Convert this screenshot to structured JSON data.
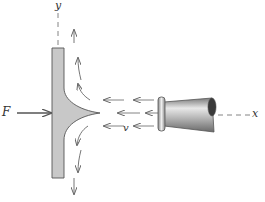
{
  "diagram": {
    "title": "",
    "type": "physics-free-body-jet-impinging-on-plate",
    "labels": {
      "y_axis": "y",
      "x_axis": "x",
      "force": "F",
      "velocity": "v"
    },
    "elements": [
      {
        "id": "plate",
        "description": "Vertical flat plate",
        "color": "#c8c8c8"
      },
      {
        "id": "nozzle",
        "description": "Nozzle emitting horizontal water jet leftward along x-axis"
      },
      {
        "id": "jet-spread",
        "description": "Jet splits symmetrically up and down along plate surface"
      },
      {
        "id": "force-arrow",
        "description": "Horizontal force F pushing plate to the right"
      },
      {
        "id": "velocity-arrows",
        "description": "Leftward arrows indicating jet velocity v"
      },
      {
        "id": "flow-arrows-up",
        "description": "Curved arrows showing flow deflected upward"
      },
      {
        "id": "flow-arrows-down",
        "description": "Curved arrows showing flow deflected downward"
      }
    ],
    "colors": {
      "plate_fill": "#c8c8c8",
      "stroke": "#555555",
      "arrow": "#666666"
    }
  }
}
